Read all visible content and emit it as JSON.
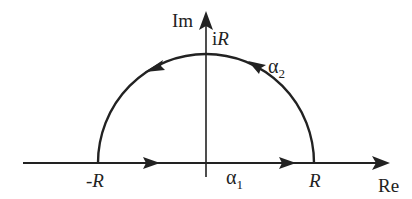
{
  "diagram": {
    "type": "contour-diagram",
    "colors": {
      "line": "#222222",
      "background": "#ffffff"
    },
    "axes": {
      "real_label": "Re",
      "imag_label": "Im"
    },
    "points": {
      "neg_R": "-R",
      "pos_R": "R",
      "iR_prefix": "i",
      "iR_var": "R"
    },
    "paths": {
      "alpha1": {
        "symbol": "α",
        "subscript": "1",
        "description": "segment from -R to R along real axis"
      },
      "alpha2": {
        "symbol": "α",
        "subscript": "2",
        "description": "semicircular arc from R through iR to -R"
      }
    }
  }
}
